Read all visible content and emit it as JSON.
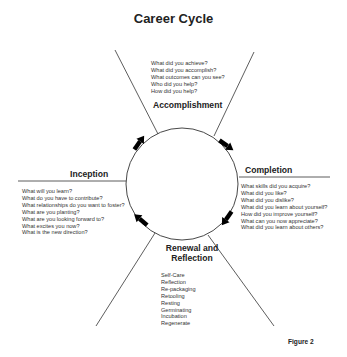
{
  "title": "Career Cycle",
  "figure_label": "Figure 2",
  "phases": {
    "accomplishment": {
      "label": "Accomplishment",
      "questions": [
        "What did you achieve?",
        "What did you accomplish?",
        "What outcomes can you see?",
        "Who did you help?",
        "How did you help?"
      ]
    },
    "completion": {
      "label": "Completion",
      "questions": [
        "What skills did you acquire?",
        "What did you like?",
        "What did you dislike?",
        "What did you learn about yourself?",
        "How did you improve yourself?",
        "What can you now appreciate?",
        "What did you learn about others?"
      ]
    },
    "renewal": {
      "label_line1": "Renewal and",
      "label_line2": "Reflection",
      "items": [
        "Self-Care",
        "Reflection",
        "Re-packaging",
        "Retooling",
        "Resting",
        "Germinating",
        "Incubation",
        "Regenerate"
      ]
    },
    "inception": {
      "label": "Inception",
      "questions": [
        "What will you learn?",
        "What do you have to contribute?",
        "What relationships do you want to foster?",
        "What are you planting?",
        "What are you looking forward to?",
        "What excites you now?",
        "What is the new direction?"
      ]
    }
  },
  "cycle": {
    "direction": "clockwise",
    "arrow_color": "#000000",
    "line_color": "#333333"
  }
}
